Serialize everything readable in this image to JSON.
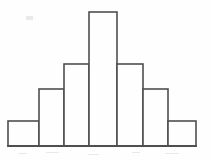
{
  "figure": {
    "kind": "histogram-figure",
    "background_color": "#fefefe",
    "line_color": "#4f4f4f",
    "bar_fill_color": "#fefefe",
    "baseline_y": 146,
    "plot_left_x": 8,
    "plot_right_x": 196
  },
  "chart_data": {
    "type": "bar",
    "title": "",
    "subtitle": "",
    "xlabel": "",
    "ylabel": "",
    "categories": [
      "1",
      "2",
      "3",
      "4",
      "5",
      "6",
      "7"
    ],
    "values": [
      1,
      2.3,
      3.3,
      5.4,
      3.3,
      2.3,
      1
    ],
    "ylim": [
      0,
      5.4
    ],
    "xlim": [
      0,
      7
    ],
    "grid": false,
    "legend": null,
    "legend_position": "none",
    "annotations": [],
    "tick_labels": {
      "x": [],
      "y": []
    },
    "bars": [
      {
        "index": 0,
        "label": "1",
        "value": 1,
        "x_left": 8,
        "x_right": 39,
        "top_y": 121,
        "pixel_height": 25,
        "pixel_width": 31
      },
      {
        "index": 1,
        "label": "2",
        "value": 2.3,
        "x_left": 39,
        "x_right": 64,
        "top_y": 89,
        "pixel_height": 57,
        "pixel_width": 25
      },
      {
        "index": 2,
        "label": "3",
        "value": 3.3,
        "x_left": 64,
        "x_right": 89,
        "top_y": 64,
        "pixel_height": 82,
        "pixel_width": 25
      },
      {
        "index": 3,
        "label": "4",
        "value": 5.4,
        "x_left": 89,
        "x_right": 117,
        "top_y": 12,
        "pixel_height": 134,
        "pixel_width": 28
      },
      {
        "index": 4,
        "label": "5",
        "value": 3.3,
        "x_left": 117,
        "x_right": 143,
        "top_y": 64,
        "pixel_height": 82,
        "pixel_width": 26
      },
      {
        "index": 5,
        "label": "6",
        "value": 2.3,
        "x_left": 143,
        "x_right": 168,
        "top_y": 89,
        "pixel_height": 57,
        "pixel_width": 25
      },
      {
        "index": 6,
        "label": "7",
        "value": 1,
        "x_left": 168,
        "x_right": 196,
        "top_y": 121,
        "pixel_height": 25,
        "pixel_width": 28
      }
    ]
  }
}
